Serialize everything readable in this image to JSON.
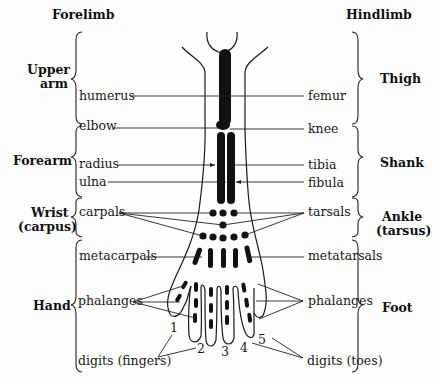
{
  "headers": {
    "left": "Forelimb",
    "right": "Hindlimb"
  },
  "regions": {
    "left": [
      {
        "line1": "Upper",
        "line2": "arm"
      },
      {
        "line1": "Forearm"
      },
      {
        "line1": "Wrist",
        "line2": "(carpus)"
      },
      {
        "line1": "Hand"
      }
    ],
    "right": [
      {
        "line1": "Thigh"
      },
      {
        "line1": "Shank"
      },
      {
        "line1": "Ankle",
        "line2": "(tarsus)"
      },
      {
        "line1": "Foot"
      }
    ]
  },
  "labels": {
    "left": {
      "humerus": "humerus",
      "elbow": "elbow",
      "radius": "radius",
      "ulna": "ulna",
      "carpals": "carpals",
      "metacarpals": "metacarpals",
      "phalanges": "phalanges",
      "digits": "digits (fingers)"
    },
    "right": {
      "femur": "femur",
      "knee": "knee",
      "tibia": "tibia",
      "fibula": "fibula",
      "tarsals": "tarsals",
      "metatarsals": "metatarsals",
      "phalanges": "phalanges",
      "digits": "digits (toes)"
    }
  },
  "digit_numbers": [
    "1",
    "2",
    "3",
    "4",
    "5"
  ]
}
